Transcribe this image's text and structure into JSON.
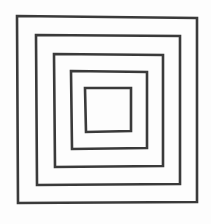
{
  "figure": {
    "description": "Hand-drawn sketch of five concentric squares",
    "stroke_color": "#3a3a3a",
    "background_color": "#fdfdfd",
    "stroke_width": 2.6,
    "squares": [
      {
        "name": "square-1-outer",
        "points": "17,16 197,18 197,202 18,203"
      },
      {
        "name": "square-2",
        "points": "36,35 180,36 180,184 37,185"
      },
      {
        "name": "square-3",
        "points": "54,54 163,55 163,166 55,167"
      },
      {
        "name": "square-4",
        "points": "71,71 147,72 147,148 72,149"
      },
      {
        "name": "square-5-inner",
        "points": "85,88 131,88 131,131 86,132"
      }
    ]
  }
}
